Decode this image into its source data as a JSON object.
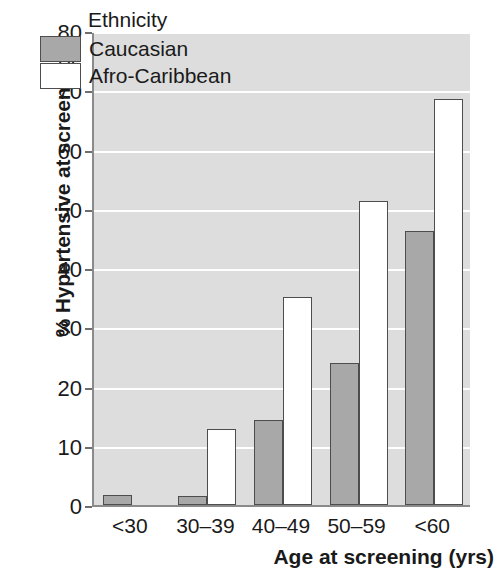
{
  "chart_data": {
    "type": "bar",
    "title": "",
    "xlabel": "Age at screening (yrs)",
    "ylabel": "% Hypertensive at screening",
    "categories": [
      "<30",
      "30–39",
      "40–49",
      "50–59",
      "<60"
    ],
    "series": [
      {
        "name": "Caucasian",
        "values": [
          1.7,
          1.6,
          14.3,
          24.0,
          46.2
        ],
        "color": "#a8a8a8"
      },
      {
        "name": "Afro-Caribbean",
        "values": [
          0,
          12.9,
          35.1,
          51.3,
          68.6
        ],
        "color": "#ffffff"
      }
    ],
    "ylim": [
      0,
      80
    ],
    "yticks": [
      0,
      10,
      20,
      30,
      40,
      50,
      60,
      70,
      80
    ],
    "ytick_labels": [
      "0",
      "10",
      "20",
      "30",
      "40",
      "50",
      "60",
      "70",
      "80"
    ],
    "grid": true,
    "grid_color": "#ffffff",
    "plot_background": "#dddddd",
    "legend": {
      "title": "Ethnicity",
      "position": "top-left-inside",
      "entries": [
        {
          "label": "Caucasian",
          "swatch": "#a8a8a8"
        },
        {
          "label": "Afro-Caribbean",
          "swatch": "#ffffff"
        }
      ]
    }
  }
}
